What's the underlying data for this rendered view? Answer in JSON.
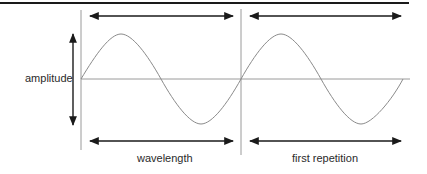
{
  "diagram": {
    "type": "sine-wave-anatomy",
    "colors": {
      "rule": "#1a1a1a",
      "arrow": "#1a1a1a",
      "wave": "#8a8a8a",
      "guide": "#9a9a9a",
      "text": "#2a2a2a",
      "background": "#ffffff"
    },
    "labels": {
      "amplitude": "amplitude",
      "wavelength": "wavelength",
      "first_repetition": "first repetition"
    },
    "geometry": {
      "baseline_y": 79,
      "wave_start_x": 81,
      "wavelength_px": 160,
      "amplitude_px": 45,
      "cycles_shown": 2,
      "divider_x": 241
    },
    "annotations": [
      {
        "kind": "double-arrow",
        "position": "top",
        "span": "first wavelength"
      },
      {
        "kind": "double-arrow",
        "position": "top",
        "span": "second wavelength"
      },
      {
        "kind": "double-arrow",
        "position": "bottom",
        "span": "wavelength",
        "label_ref": "wavelength"
      },
      {
        "kind": "double-arrow",
        "position": "bottom",
        "span": "first repetition",
        "label_ref": "first_repetition"
      },
      {
        "kind": "double-arrow",
        "orientation": "vertical",
        "span": "amplitude",
        "label_ref": "amplitude"
      }
    ]
  }
}
